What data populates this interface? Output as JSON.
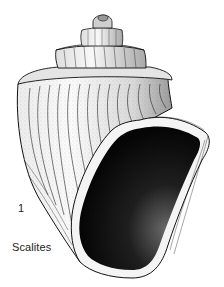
{
  "figure": {
    "number": "1",
    "caption": "Scalites",
    "colors": {
      "background": "#ffffff",
      "ink": "#111111",
      "aperture_fill": "#0a0a0a"
    }
  }
}
